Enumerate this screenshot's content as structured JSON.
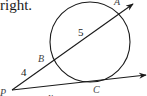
{
  "caption": {
    "text": "right."
  },
  "diagram": {
    "points": {
      "A": {
        "label": "A",
        "x": 116,
        "y": 4
      },
      "B": {
        "label": "B",
        "x": 38,
        "y": 62
      },
      "P": {
        "label": "P",
        "x": 0,
        "y": 96
      },
      "C": {
        "label": "C",
        "x": 93,
        "y": 92
      }
    },
    "segment_labels": {
      "PB": {
        "label": "4",
        "x": 22,
        "y": 78
      },
      "BA": {
        "label": "5",
        "x": 79,
        "y": 35
      },
      "PC": {
        "label": "x",
        "x": 48,
        "y": 101
      }
    },
    "colors": {
      "stroke": "#1a1a1a",
      "label": "#1a1a1a",
      "point_label": "#444444",
      "background": "#ffffff"
    }
  }
}
